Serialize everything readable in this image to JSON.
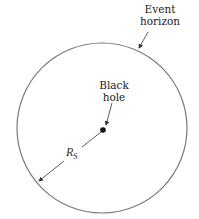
{
  "labels": {
    "event_horizon_line1": "Event",
    "event_horizon_line2": "horizon",
    "black_hole_line1": "Black",
    "black_hole_line2": "hole",
    "radius_symbol": "R",
    "radius_subscript": "S"
  },
  "colors": {
    "circle": "#7a7a7a",
    "arrow": "#333333",
    "dot": "#111111"
  }
}
